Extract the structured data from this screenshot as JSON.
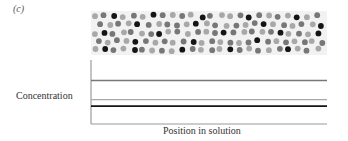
{
  "figure": {
    "panel_label": "(c)",
    "y_axis_label": "Concentration",
    "x_axis_label": "Position in solution"
  },
  "colors": {
    "light": "#a8a8a8",
    "mid": "#777777",
    "dark": "#151515",
    "axis": "#888888",
    "strip_bg": "#f2f2f2"
  },
  "particles": {
    "strip": {
      "x": 91,
      "y": 11,
      "width": 236,
      "height": 44
    },
    "rows": 5,
    "cols": 24,
    "pattern": "LMDLMLDMLMLDMLLMDMLMLDLM|MLMLDMLMMLDLMLMLMDLMLMLD|LDMLMLMDLMLMLMDMLMLMDLMLD|MLMLDMLMLMDLMLMLMDMLMLMLM|LDMLDMLMLDMLMLDMLMLMDLML"
  },
  "chart_data": {
    "type": "line",
    "title": "(c)",
    "xlabel": "Position in solution",
    "ylabel": "Concentration",
    "grid": false,
    "x": [
      0,
      1
    ],
    "series": [
      {
        "name": "mid-gray solute",
        "color": "#777777",
        "values": [
          0.68,
          0.68
        ]
      },
      {
        "name": "light-gray solute",
        "color": "#a8a8a8",
        "values": [
          0.38,
          0.38
        ]
      },
      {
        "name": "black solute",
        "color": "#151515",
        "values": [
          0.28,
          0.28
        ]
      }
    ],
    "ylim": [
      0,
      1
    ],
    "note": "Uniform (flat) concentration of each solute across the solution"
  }
}
